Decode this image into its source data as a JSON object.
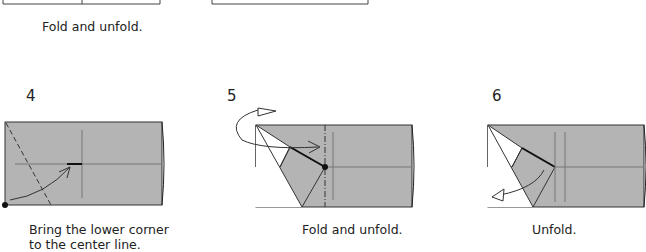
{
  "top": {
    "caption": "Fold and unfold."
  },
  "steps": [
    {
      "number": "4",
      "caption_line1": "Bring the lower corner",
      "caption_line2": "to the center line."
    },
    {
      "number": "5",
      "caption": "Fold and unfold."
    },
    {
      "number": "6",
      "caption": "Unfold."
    }
  ],
  "colors": {
    "paper": "#b4b4b4",
    "line": "#333333",
    "white": "#ffffff"
  }
}
